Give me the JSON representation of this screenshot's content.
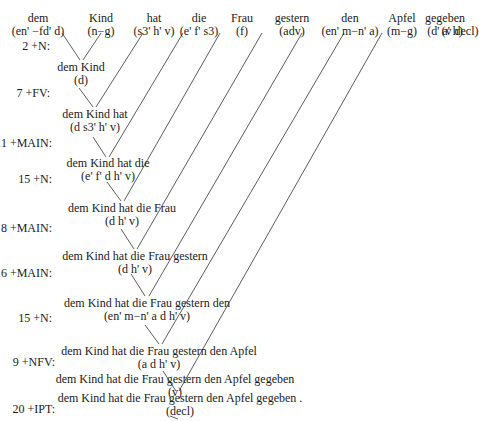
{
  "words": [
    {
      "form": "dem",
      "cat": "(en' −fd' d)",
      "x": 38
    },
    {
      "form": "Kind",
      "cat": "(n−g)",
      "x": 103
    },
    {
      "form": "hat",
      "cat": "(s3' h' v)",
      "x": 164
    },
    {
      "form": "die",
      "cat": "(e' f' s3)",
      "x": 222
    },
    {
      "form": "Frau",
      "cat": "(f)",
      "x": 268
    },
    {
      "form": "gestern",
      "cat": "(adv)",
      "x": 322
    },
    {
      "form": "den",
      "cat": "(en' m−n' a)",
      "x": 367
    },
    {
      "form": "Apfel",
      "cat": "(m−g)",
      "x": 406
    },
    {
      "form": "gegeben",
      "cat": "(d' a' h)",
      "x": 426
    },
    {
      "form": ".",
      "cat": "(v decl)",
      "x": 442
    }
  ],
  "steps": [
    {
      "rule": "2 +N:",
      "surface": "dem Kind",
      "cat": "(d)"
    },
    {
      "rule": "7 +FV:",
      "surface": "dem Kind hat",
      "cat": "(d s3' h' v)"
    },
    {
      "rule": "11 +MAIN:",
      "surface": "dem Kind hat die",
      "cat": "(e' f' d h' v)"
    },
    {
      "rule": "15 +N:",
      "surface": "dem Kind hat die Frau",
      "cat": "(d h' v)"
    },
    {
      "rule": "8 +MAIN:",
      "surface": "dem Kind hat die Frau gestern",
      "cat": "(d h' v)"
    },
    {
      "rule": "16 +MAIN:",
      "surface": "dem Kind hat die Frau gestern den",
      "cat": "(en' m−n' a d h' v)"
    },
    {
      "rule": "15 +N:",
      "surface": "dem Kind hat die Frau gestern den Apfel",
      "cat": "(a d h' v)"
    },
    {
      "rule": "9 +NFV:",
      "surface": "dem Kind hat die Frau gestern den Apfel gegeben",
      "cat": "(v)"
    },
    {
      "rule": "20 +IPT:",
      "surface": "dem Kind hat die Frau gestern den Apfel gegeben .",
      "cat": "(decl)"
    }
  ]
}
